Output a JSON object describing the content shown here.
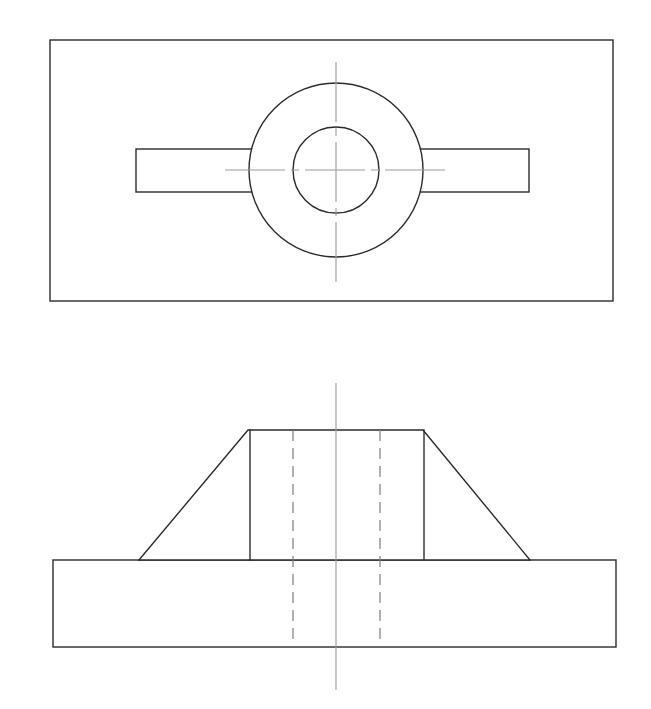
{
  "document": {
    "title": "Orthographic Engineering Drawing",
    "sheet_background": "#ffffff",
    "width_px": 651,
    "height_px": 709,
    "line_colors": {
      "visible_edge": "#2b2b2b",
      "hidden_edge": "#7d7d7d",
      "center_line": "#9a9a9a"
    }
  },
  "views": {
    "top_view": {
      "name": "top-view",
      "label": "Top View (Plan)",
      "outline_rect": {
        "x": 50,
        "y": 40,
        "width": 563,
        "height": 261
      },
      "rib_rect": {
        "x": 136,
        "y": 149,
        "width": 393,
        "height": 43
      },
      "outer_circle": {
        "cx": 336,
        "cy": 170,
        "r": 87
      },
      "inner_circle": {
        "cx": 336,
        "cy": 170,
        "r": 43
      },
      "vertical_center_line": {
        "x": 336,
        "y1": 62,
        "y2": 288
      },
      "horizontal_center_line": {
        "y": 170,
        "x1": 225,
        "x2": 446
      }
    },
    "front_view": {
      "name": "front-view",
      "label": "Front View (Elevation)",
      "base_rect": {
        "x": 53,
        "y": 560,
        "width": 563,
        "height": 87
      },
      "boss_outline_points": "139,560 248,430 423,430 530,560",
      "boss_top_y": 430,
      "boss_top_left_x": 248,
      "boss_top_right_x": 423,
      "boss_wall_left_x": 250,
      "boss_wall_right_x": 424,
      "boss_wall_bottom_y": 560,
      "slope_left": {
        "x1": 139,
        "y1": 560,
        "x2": 248,
        "y2": 430
      },
      "slope_right": {
        "x1": 423,
        "y1": 430,
        "x2": 530,
        "y2": 560
      },
      "hidden_line_left": {
        "x": 293,
        "y1": 430,
        "y2": 646
      },
      "hidden_line_right": {
        "x": 380,
        "y1": 430,
        "y2": 646
      },
      "vertical_center_line": {
        "x": 336,
        "y1": 383,
        "y2": 690
      }
    }
  },
  "geometry_summary": {
    "part_type": "flanged boss with rectangular base and tapered hub",
    "feature_counts": {
      "circles": 2,
      "hidden_lines": 2,
      "center_lines": 3,
      "rectangles": 3
    }
  }
}
